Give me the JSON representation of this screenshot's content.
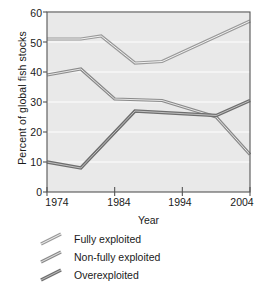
{
  "chart_data": {
    "type": "line",
    "title": "",
    "xlabel": "Year",
    "ylabel": "Percent of global fish stocks",
    "xlim": [
      1974,
      2004
    ],
    "ylim": [
      0,
      60
    ],
    "grid": true,
    "legend_position": "below",
    "x_ticks": [
      1974,
      1984,
      1994,
      2004
    ],
    "y_ticks": [
      0,
      10,
      20,
      30,
      40,
      50,
      60
    ],
    "series": [
      {
        "name": "Fully exploited",
        "color": "#9a9a9a",
        "x": [
          1974,
          1979,
          1982,
          1987,
          1991,
          2004
        ],
        "values": [
          51,
          51,
          52,
          43,
          43.5,
          57
        ]
      },
      {
        "name": "Non-fully exploited",
        "color": "#8a8a8a",
        "x": [
          1974,
          1979,
          1984,
          1991,
          1999,
          2004
        ],
        "values": [
          39,
          41,
          31,
          30.5,
          25,
          12.5
        ]
      },
      {
        "name": "Overexploited",
        "color": "#6e6e6e",
        "x": [
          1974,
          1979,
          1987,
          1999,
          2004
        ],
        "values": [
          10,
          8,
          27,
          25.5,
          30.5
        ]
      }
    ]
  },
  "axis": {
    "y_tick_labels": [
      "60",
      "50",
      "40",
      "30",
      "20",
      "10",
      "0"
    ],
    "x_tick_labels": [
      "1974",
      "1984",
      "1994",
      "2004"
    ],
    "x_title": "Year",
    "y_title": "Percent of global fish stocks"
  },
  "legend": {
    "items": [
      {
        "label": "Fully exploited",
        "color": "#9a9a9a",
        "swatch": "line-swatch"
      },
      {
        "label": "Non-fully exploited",
        "color": "#8a8a8a",
        "swatch": "line-swatch"
      },
      {
        "label": "Overexploited",
        "color": "#6e6e6e",
        "swatch": "line-swatch"
      }
    ]
  },
  "style": {
    "plot_background": "#e9e9e9",
    "grid_color": "#f7f7f7",
    "axis_color": "#555555",
    "text_color": "#1a1a1a"
  }
}
